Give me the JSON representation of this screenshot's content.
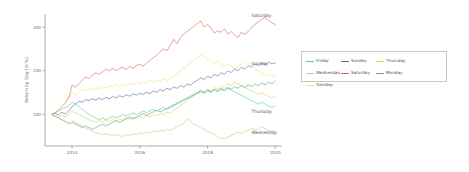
{
  "chart_data": {
    "type": "line",
    "title": "",
    "xlabel": "",
    "ylabel": "Return by Day (in %)",
    "xticks": [
      "2014",
      "2016",
      "2018",
      "2020"
    ],
    "xtick_values": [
      2014,
      2016,
      2018,
      2020
    ],
    "yticks": [
      "100",
      "200",
      "300"
    ],
    "ytick_values": [
      100,
      200,
      300
    ],
    "xlim": [
      2013.2,
      2020.2
    ],
    "ylim": [
      28,
      330
    ],
    "grid": false,
    "legend_position": "right-outside",
    "legend_entries": [
      "Friday",
      "Sunday",
      "Thursday",
      "Wednesday",
      "Saturday",
      "Monday",
      "Tuesday"
    ],
    "annotations": [
      {
        "text": "Saturday",
        "x": 2019.3,
        "y": 322
      },
      {
        "text": "Sunday",
        "x": 2019.3,
        "y": 213
      },
      {
        "text": "Thursday",
        "x": 2019.3,
        "y": 103
      },
      {
        "text": "Wednesday",
        "x": 2019.3,
        "y": 55
      }
    ],
    "colors": {
      "Friday": "#64c4b4",
      "Saturday": "#d96a52",
      "Sunday": "#5a6fa8",
      "Monday": "#5aa87a",
      "Thursday": "#cfd46a",
      "Tuesday": "#f2e07a",
      "Wednesday": "#c3cf82"
    },
    "series": [
      {
        "name": "Saturday",
        "color": "#d96a52",
        "x": [
          2013.4,
          2013.5,
          2013.6,
          2013.7,
          2013.8,
          2013.9,
          2013.95,
          2014.0,
          2014.1,
          2014.2,
          2014.3,
          2014.4,
          2014.5,
          2014.6,
          2014.7,
          2014.8,
          2014.9,
          2015.0,
          2015.1,
          2015.2,
          2015.3,
          2015.4,
          2015.5,
          2015.6,
          2015.7,
          2015.8,
          2015.9,
          2016.0,
          2016.1,
          2016.2,
          2016.3,
          2016.4,
          2016.5,
          2016.6,
          2016.7,
          2016.8,
          2016.9,
          2017.0,
          2017.1,
          2017.2,
          2017.3,
          2017.4,
          2017.5,
          2017.6,
          2017.7,
          2017.8,
          2017.9,
          2018.0,
          2018.1,
          2018.2,
          2018.3,
          2018.4,
          2018.5,
          2018.6,
          2018.7,
          2018.8,
          2018.9,
          2019.0,
          2019.1,
          2019.2,
          2019.3,
          2019.4,
          2019.5,
          2019.6,
          2019.7,
          2019.8,
          2019.9,
          2020.0
        ],
        "y": [
          100,
          104,
          110,
          118,
          126,
          140,
          152,
          168,
          162,
          170,
          178,
          186,
          182,
          190,
          196,
          192,
          198,
          204,
          200,
          206,
          200,
          205,
          208,
          203,
          210,
          206,
          212,
          215,
          211,
          218,
          224,
          230,
          236,
          244,
          250,
          246,
          258,
          272,
          262,
          276,
          284,
          290,
          296,
          302,
          308,
          314,
          300,
          306,
          298,
          286,
          292,
          288,
          296,
          284,
          290,
          282,
          276,
          288,
          284,
          290,
          298,
          306,
          312,
          318,
          322,
          316,
          310,
          306
        ]
      },
      {
        "name": "Sunday",
        "color": "#5a6fa8",
        "x": [
          2013.4,
          2013.5,
          2013.6,
          2013.7,
          2013.8,
          2013.9,
          2013.95,
          2014.0,
          2014.1,
          2014.2,
          2014.3,
          2014.4,
          2014.5,
          2014.6,
          2014.7,
          2014.8,
          2014.9,
          2015.0,
          2015.1,
          2015.2,
          2015.3,
          2015.4,
          2015.5,
          2015.6,
          2015.7,
          2015.8,
          2015.9,
          2016.0,
          2016.1,
          2016.2,
          2016.3,
          2016.4,
          2016.5,
          2016.6,
          2016.7,
          2016.8,
          2016.9,
          2017.0,
          2017.1,
          2017.2,
          2017.3,
          2017.4,
          2017.5,
          2017.6,
          2017.7,
          2017.8,
          2017.9,
          2018.0,
          2018.1,
          2018.2,
          2018.3,
          2018.4,
          2018.5,
          2018.6,
          2018.7,
          2018.8,
          2018.9,
          2019.0,
          2019.1,
          2019.2,
          2019.3,
          2019.4,
          2019.5,
          2019.6,
          2019.7,
          2019.8,
          2019.9,
          2020.0
        ],
        "y": [
          100,
          103,
          99,
          105,
          101,
          108,
          112,
          118,
          124,
          130,
          128,
          134,
          132,
          136,
          133,
          138,
          134,
          139,
          136,
          141,
          138,
          143,
          140,
          145,
          142,
          147,
          144,
          149,
          146,
          151,
          148,
          154,
          151,
          157,
          154,
          160,
          157,
          163,
          160,
          166,
          163,
          170,
          167,
          174,
          178,
          184,
          180,
          188,
          184,
          192,
          188,
          196,
          192,
          200,
          196,
          204,
          200,
          208,
          204,
          212,
          208,
          216,
          212,
          218,
          214,
          220,
          216,
          218
        ]
      },
      {
        "name": "Tuesday",
        "color": "#f2e07a",
        "x": [
          2013.4,
          2013.5,
          2013.6,
          2013.7,
          2013.8,
          2013.9,
          2013.95,
          2014.0,
          2014.1,
          2014.2,
          2014.3,
          2014.4,
          2014.5,
          2014.6,
          2014.7,
          2014.8,
          2014.9,
          2015.0,
          2015.1,
          2015.2,
          2015.3,
          2015.4,
          2015.5,
          2015.6,
          2015.7,
          2015.8,
          2015.9,
          2016.0,
          2016.1,
          2016.2,
          2016.3,
          2016.4,
          2016.5,
          2016.6,
          2016.7,
          2016.8,
          2016.9,
          2017.0,
          2017.1,
          2017.2,
          2017.3,
          2017.4,
          2017.5,
          2017.6,
          2017.7,
          2017.8,
          2017.9,
          2018.0,
          2018.1,
          2018.2,
          2018.3,
          2018.4,
          2018.5,
          2018.6,
          2018.7,
          2018.8,
          2018.9,
          2019.0,
          2019.1,
          2019.2,
          2019.3,
          2019.4,
          2019.5,
          2019.6,
          2019.7,
          2019.8,
          2019.9,
          2020.0
        ],
        "y": [
          100,
          106,
          112,
          120,
          128,
          136,
          142,
          150,
          144,
          152,
          158,
          154,
          160,
          156,
          162,
          158,
          164,
          160,
          166,
          162,
          168,
          164,
          170,
          166,
          172,
          168,
          174,
          170,
          176,
          172,
          178,
          174,
          180,
          176,
          182,
          178,
          184,
          188,
          194,
          200,
          206,
          212,
          218,
          224,
          230,
          236,
          232,
          228,
          222,
          216,
          222,
          216,
          210,
          216,
          210,
          204,
          210,
          216,
          222,
          218,
          212,
          206,
          200,
          194,
          188,
          192,
          186,
          190
        ]
      },
      {
        "name": "Thursday",
        "color": "#cfd46a",
        "x": [
          2013.4,
          2013.5,
          2013.6,
          2013.7,
          2013.8,
          2013.9,
          2013.95,
          2014.0,
          2014.1,
          2014.2,
          2014.3,
          2014.4,
          2014.5,
          2014.6,
          2014.7,
          2014.8,
          2014.9,
          2015.0,
          2015.1,
          2015.2,
          2015.3,
          2015.4,
          2015.5,
          2015.6,
          2015.7,
          2015.8,
          2015.9,
          2016.0,
          2016.1,
          2016.2,
          2016.3,
          2016.4,
          2016.5,
          2016.6,
          2016.7,
          2016.8,
          2016.9,
          2017.0,
          2017.1,
          2017.2,
          2017.3,
          2017.4,
          2017.5,
          2017.6,
          2017.7,
          2017.8,
          2017.9,
          2018.0,
          2018.1,
          2018.2,
          2018.3,
          2018.4,
          2018.5,
          2018.6,
          2018.7,
          2018.8,
          2018.9,
          2019.0,
          2019.1,
          2019.2,
          2019.3,
          2019.4,
          2019.5,
          2019.6,
          2019.7,
          2019.8,
          2019.9,
          2020.0
        ],
        "y": [
          100,
          97,
          94,
          98,
          95,
          100,
          104,
          108,
          104,
          100,
          96,
          92,
          88,
          85,
          82,
          86,
          83,
          87,
          84,
          88,
          85,
          90,
          87,
          92,
          89,
          94,
          91,
          96,
          93,
          98,
          95,
          100,
          97,
          103,
          100,
          106,
          103,
          110,
          114,
          120,
          126,
          132,
          138,
          144,
          150,
          156,
          152,
          158,
          154,
          162,
          158,
          166,
          162,
          170,
          166,
          174,
          170,
          166,
          162,
          158,
          154,
          150,
          146,
          150,
          146,
          142,
          138,
          142
        ]
      },
      {
        "name": "Monday",
        "color": "#5aa87a",
        "x": [
          2013.4,
          2013.5,
          2013.6,
          2013.7,
          2013.8,
          2013.9,
          2013.95,
          2014.0,
          2014.1,
          2014.2,
          2014.3,
          2014.4,
          2014.5,
          2014.6,
          2014.7,
          2014.8,
          2014.9,
          2015.0,
          2015.1,
          2015.2,
          2015.3,
          2015.4,
          2015.5,
          2015.6,
          2015.7,
          2015.8,
          2015.9,
          2016.0,
          2016.1,
          2016.2,
          2016.3,
          2016.4,
          2016.5,
          2016.6,
          2016.7,
          2016.8,
          2016.9,
          2017.0,
          2017.1,
          2017.2,
          2017.3,
          2017.4,
          2017.5,
          2017.6,
          2017.7,
          2017.8,
          2017.9,
          2018.0,
          2018.1,
          2018.2,
          2018.3,
          2018.4,
          2018.5,
          2018.6,
          2018.7,
          2018.8,
          2018.9,
          2019.0,
          2019.1,
          2019.2,
          2019.3,
          2019.4,
          2019.5,
          2019.6,
          2019.7,
          2019.8,
          2019.9,
          2020.0
        ],
        "y": [
          100,
          96,
          92,
          88,
          84,
          80,
          78,
          82,
          78,
          74,
          70,
          74,
          70,
          66,
          70,
          74,
          78,
          74,
          78,
          82,
          86,
          82,
          86,
          90,
          94,
          90,
          94,
          98,
          102,
          98,
          102,
          106,
          110,
          106,
          110,
          114,
          118,
          122,
          126,
          130,
          134,
          138,
          142,
          146,
          150,
          154,
          150,
          156,
          152,
          158,
          154,
          160,
          156,
          162,
          158,
          164,
          160,
          166,
          162,
          168,
          164,
          170,
          166,
          172,
          168,
          174,
          170,
          176
        ]
      },
      {
        "name": "Friday",
        "color": "#64c4b4",
        "x": [
          2013.4,
          2013.5,
          2013.6,
          2013.7,
          2013.8,
          2013.9,
          2013.95,
          2014.0,
          2014.1,
          2014.2,
          2014.3,
          2014.4,
          2014.5,
          2014.6,
          2014.7,
          2014.8,
          2014.9,
          2015.0,
          2015.1,
          2015.2,
          2015.3,
          2015.4,
          2015.5,
          2015.6,
          2015.7,
          2015.8,
          2015.9,
          2016.0,
          2016.1,
          2016.2,
          2016.3,
          2016.4,
          2016.5,
          2016.6,
          2016.7,
          2016.8,
          2016.9,
          2017.0,
          2017.1,
          2017.2,
          2017.3,
          2017.4,
          2017.5,
          2017.6,
          2017.7,
          2017.8,
          2017.9,
          2018.0,
          2018.1,
          2018.2,
          2018.3,
          2018.4,
          2018.5,
          2018.6,
          2018.7,
          2018.8,
          2018.9,
          2019.0,
          2019.1,
          2019.2,
          2019.3,
          2019.4,
          2019.5,
          2019.6,
          2019.7,
          2019.8,
          2019.9,
          2020.0
        ],
        "y": [
          100,
          104,
          108,
          112,
          116,
          120,
          124,
          128,
          124,
          118,
          112,
          106,
          100,
          96,
          92,
          88,
          92,
          88,
          92,
          96,
          92,
          96,
          100,
          96,
          100,
          104,
          100,
          104,
          108,
          104,
          108,
          112,
          108,
          112,
          116,
          112,
          116,
          120,
          124,
          128,
          132,
          136,
          140,
          144,
          148,
          152,
          148,
          154,
          150,
          156,
          152,
          158,
          154,
          160,
          156,
          152,
          148,
          144,
          140,
          136,
          132,
          128,
          124,
          128,
          124,
          120,
          116,
          120
        ]
      },
      {
        "name": "Wednesday",
        "color": "#c3cf82",
        "x": [
          2013.4,
          2013.5,
          2013.6,
          2013.7,
          2013.8,
          2013.9,
          2013.95,
          2014.0,
          2014.1,
          2014.2,
          2014.3,
          2014.4,
          2014.5,
          2014.6,
          2014.7,
          2014.8,
          2014.9,
          2015.0,
          2015.1,
          2015.2,
          2015.3,
          2015.4,
          2015.5,
          2015.6,
          2015.7,
          2015.8,
          2015.9,
          2016.0,
          2016.1,
          2016.2,
          2016.3,
          2016.4,
          2016.5,
          2016.6,
          2016.7,
          2016.8,
          2016.9,
          2017.0,
          2017.1,
          2017.2,
          2017.3,
          2017.4,
          2017.5,
          2017.6,
          2017.7,
          2017.8,
          2017.9,
          2018.0,
          2018.1,
          2018.2,
          2018.3,
          2018.4,
          2018.5,
          2018.6,
          2018.7,
          2018.8,
          2018.9,
          2019.0,
          2019.1,
          2019.2,
          2019.3,
          2019.4,
          2019.5,
          2019.6,
          2019.7,
          2019.8,
          2019.9,
          2020.0
        ],
        "y": [
          100,
          96,
          92,
          88,
          84,
          80,
          82,
          86,
          82,
          78,
          74,
          70,
          66,
          62,
          58,
          56,
          54,
          56,
          54,
          52,
          54,
          52,
          50,
          54,
          52,
          56,
          54,
          58,
          56,
          60,
          58,
          62,
          60,
          64,
          62,
          66,
          64,
          68,
          72,
          76,
          80,
          90,
          84,
          78,
          74,
          70,
          66,
          62,
          58,
          54,
          50,
          46,
          44,
          48,
          52,
          56,
          60,
          56,
          60,
          64,
          68,
          64,
          68,
          72,
          68,
          64,
          60,
          64
        ]
      }
    ]
  },
  "figure": {
    "yaxis_title": "Return by Day (in %)"
  }
}
